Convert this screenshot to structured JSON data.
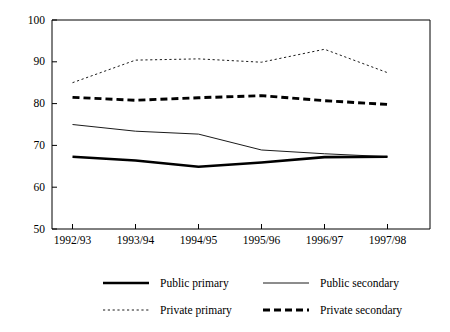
{
  "chart_data": {
    "type": "line",
    "title": "",
    "subtitle": "",
    "xlabel": "",
    "ylabel": "",
    "categories": [
      "1992/93",
      "1993/94",
      "1994/95",
      "1995/96",
      "1996/97",
      "1997/98"
    ],
    "ylim": [
      50,
      100
    ],
    "yticks": [
      50,
      60,
      70,
      80,
      90,
      100
    ],
    "ytick_labels": [
      "50",
      "60",
      "70",
      "80",
      "90",
      "100"
    ],
    "grid": false,
    "legend_position": "bottom",
    "series": [
      {
        "name": "Public primary",
        "style": "thick-solid",
        "values": [
          67.3,
          66.4,
          64.9,
          65.9,
          67.2,
          67.3
        ]
      },
      {
        "name": "Public secondary",
        "style": "thin-solid",
        "values": [
          75.0,
          73.4,
          72.7,
          68.9,
          68.0,
          67.3
        ]
      },
      {
        "name": "Private primary",
        "style": "fine-dotted",
        "values": [
          85.0,
          90.4,
          90.7,
          89.9,
          93.0,
          87.4
        ]
      },
      {
        "name": "Private secondary",
        "style": "thick-dashed",
        "values": [
          81.5,
          80.8,
          81.4,
          81.9,
          80.7,
          79.8
        ]
      }
    ]
  },
  "legend": {
    "items": [
      {
        "label": "Public primary",
        "style": "thick-solid"
      },
      {
        "label": "Public secondary",
        "style": "thin-solid"
      },
      {
        "label": "Private primary",
        "style": "fine-dotted"
      },
      {
        "label": "Private secondary",
        "style": "thick-dashed"
      }
    ]
  },
  "colors": {
    "ink": "#000000",
    "background": "#ffffff"
  }
}
